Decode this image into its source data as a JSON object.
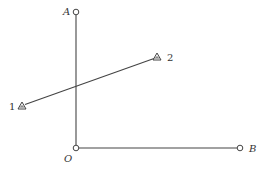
{
  "diagram": {
    "colors": {
      "line": "#444444",
      "text": "#333333",
      "background": "#ffffff"
    },
    "points": {
      "A": {
        "label": "A",
        "x": 76,
        "y": 12,
        "marker": "circle"
      },
      "O": {
        "label": "O",
        "x": 76,
        "y": 148,
        "marker": "circle"
      },
      "B": {
        "label": "B",
        "x": 240,
        "y": 148,
        "marker": "circle"
      },
      "P1": {
        "label": "1",
        "x": 22,
        "y": 106,
        "marker": "triangle"
      },
      "P2": {
        "label": "2",
        "x": 157,
        "y": 57,
        "marker": "triangle"
      }
    },
    "segments": [
      {
        "from": "A",
        "to": "O"
      },
      {
        "from": "O",
        "to": "B"
      },
      {
        "from": "P1",
        "to": "P2"
      }
    ]
  }
}
